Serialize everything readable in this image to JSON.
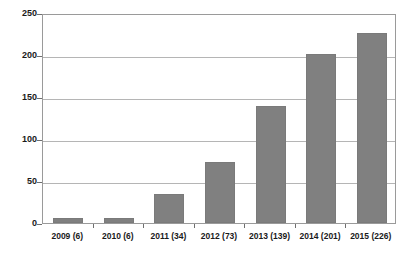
{
  "chart_data": {
    "type": "bar",
    "title": "",
    "subtitle": "",
    "xlabel": "",
    "ylabel": "",
    "categories": [
      "2009 (6)",
      "2010 (6)",
      "2011 (34)",
      "2012 (73)",
      "2013 (139)",
      "2014 (201)",
      "2015 (226)"
    ],
    "years": [
      2009,
      2010,
      2011,
      2012,
      2013,
      2014,
      2015
    ],
    "values": [
      6,
      6,
      34,
      73,
      139,
      201,
      226
    ],
    "ylim": [
      0,
      250
    ],
    "ytick_labels": [
      "0",
      "50",
      "100",
      "150",
      "200",
      "250"
    ],
    "ytick_values": [
      0,
      50,
      100,
      150,
      200,
      250
    ],
    "grid": "horizontal",
    "legend": "none",
    "bar_color": "#808080",
    "grid_color": "#b5b5b5",
    "axis_color": "#9a9a9a",
    "text_color": "#1a1a1a",
    "background": "#ffffff"
  }
}
